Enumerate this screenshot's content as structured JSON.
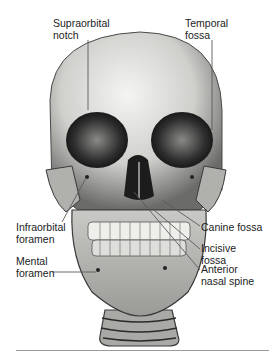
{
  "figure": {
    "labels": [
      {
        "id": "supraorbital-notch",
        "text": "Supraorbital\nnotch",
        "x": 53,
        "y": 18
      },
      {
        "id": "temporal-fossa",
        "text": "Temporal\nfossa",
        "x": 185,
        "y": 18
      },
      {
        "id": "infraorbital-foramen",
        "text": "Infraorbital\nforamen",
        "x": 16,
        "y": 222
      },
      {
        "id": "canine-fossa",
        "text": "Canine fossa",
        "x": 201,
        "y": 222
      },
      {
        "id": "incisive-fossa",
        "text": "Incisive\nfossa",
        "x": 201,
        "y": 243
      },
      {
        "id": "mental-foramen",
        "text": "Mental\nforamen",
        "x": 16,
        "y": 256
      },
      {
        "id": "anterior-nasal-spine",
        "text": "Anterior\nnasal spine",
        "x": 201,
        "y": 264
      }
    ],
    "colors": {
      "bone_light": "#e8e8e6",
      "bone_mid": "#b5b5b2",
      "bone_dark": "#3a3a3a",
      "leader_line": "#555555",
      "rule": "#9a9a9a"
    }
  }
}
